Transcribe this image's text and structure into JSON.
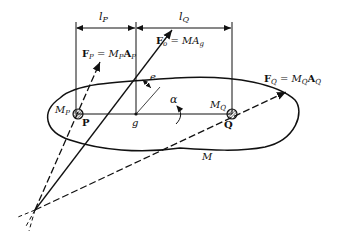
{
  "diagram": {
    "labels": {
      "l_P": "l",
      "l_P_sub": "P",
      "l_Q": "l",
      "l_Q_sub": "Q",
      "F_P": "F",
      "F_P_sub": "P",
      "F_P_eq": " = M",
      "F_P_eq_sub": "P",
      "F_P_A": "A",
      "F_P_A_sub": "P",
      "F_o": "F",
      "F_o_sub": "o",
      "F_o_eq": " = MA",
      "F_o_eq_sub": "g",
      "F_Q": "F",
      "F_Q_sub": "Q",
      "F_Q_eq": " = M",
      "F_Q_eq_sub": "Q",
      "F_Q_A": "A",
      "F_Q_A_sub": "Q",
      "M_P": "M",
      "M_P_sub": "P",
      "M_Q": "M",
      "M_Q_sub": "Q",
      "P": "P",
      "Q": "Q",
      "g": "g",
      "e": "e",
      "alpha": "α",
      "M": "M"
    }
  }
}
